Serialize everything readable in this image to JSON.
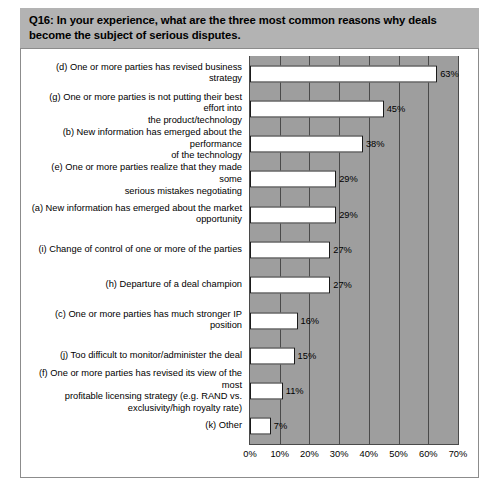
{
  "title": "Q16: In your experience, what are the three most common reasons why deals become the subject of serious disputes.",
  "colors": {
    "title_band_background": "#b3b3b3",
    "plot_background": "#9e9e9e",
    "bar_fill": "#ffffff",
    "bar_outline": "#1a1a1a",
    "gridline": "#4a4a4a",
    "page_background": "#ffffff",
    "chart_border": "#8c8c8c"
  },
  "chart_data": {
    "type": "bar",
    "orientation": "horizontal",
    "title": "Q16: In your experience, what are the three most common reasons why deals become the subject of serious disputes.",
    "xlabel": "",
    "ylabel": "",
    "xlim": [
      0,
      70
    ],
    "grid": true,
    "legend": false,
    "xticks": [
      "0%",
      "10%",
      "20%",
      "30%",
      "40%",
      "50%",
      "60%",
      "70%"
    ],
    "xtick_values": [
      0,
      10,
      20,
      30,
      40,
      50,
      60,
      70
    ],
    "categories": [
      "(d) One or more parties has revised business strategy",
      "(g) One or more parties is not putting their best effort into the product/technology",
      "(b) New information has emerged about the performance of the technology",
      "(e) One or more parties realize that they made some serious mistakes negotiating",
      "(a) New information has emerged about the market opportunity",
      "(i) Change of control of one or more of the parties",
      "(h) Departure of a deal champion",
      "(c) One or more parties has much stronger IP position",
      "(j) Too difficult to monitor/administer the deal",
      "(f) One or more parties has revised its view of the most profitable licensing strategy (e.g. RAND vs. exclusivity/high royalty rate)",
      "(k) Other"
    ],
    "values": [
      63,
      45,
      38,
      29,
      29,
      27,
      27,
      16,
      15,
      11,
      7
    ],
    "data_labels": [
      "63%",
      "45%",
      "38%",
      "29%",
      "29%",
      "27%",
      "27%",
      "16%",
      "15%",
      "11%",
      "7%"
    ]
  },
  "rows": [
    {
      "label_lines": [
        "(d) One or more parties has revised business strategy"
      ],
      "value": 63,
      "value_label": "63%"
    },
    {
      "label_lines": [
        "(g) One or more parties is not putting their best effort into",
        "the product/technology"
      ],
      "value": 45,
      "value_label": "45%"
    },
    {
      "label_lines": [
        "(b) New information has emerged about the performance",
        "of the technology"
      ],
      "value": 38,
      "value_label": "38%"
    },
    {
      "label_lines": [
        "(e) One or more parties realize that they made some",
        "serious mistakes negotiating"
      ],
      "value": 29,
      "value_label": "29%"
    },
    {
      "label_lines": [
        "(a) New information has emerged about the market",
        "opportunity"
      ],
      "value": 29,
      "value_label": "29%"
    },
    {
      "label_lines": [
        "(i) Change of control of one or more of the parties"
      ],
      "value": 27,
      "value_label": "27%"
    },
    {
      "label_lines": [
        "(h) Departure of a deal champion"
      ],
      "value": 27,
      "value_label": "27%"
    },
    {
      "label_lines": [
        "(c) One or more parties has much stronger IP position"
      ],
      "value": 16,
      "value_label": "16%"
    },
    {
      "label_lines": [
        "(j) Too difficult to monitor/administer the deal"
      ],
      "value": 15,
      "value_label": "15%"
    },
    {
      "label_lines": [
        "(f) One or more parties has revised its view of the most",
        "profitable licensing strategy (e.g. RAND vs.",
        "exclusivity/high royalty rate)"
      ],
      "value": 11,
      "value_label": "11%"
    },
    {
      "label_lines": [
        "(k) Other"
      ],
      "value": 7,
      "value_label": "7%"
    }
  ]
}
